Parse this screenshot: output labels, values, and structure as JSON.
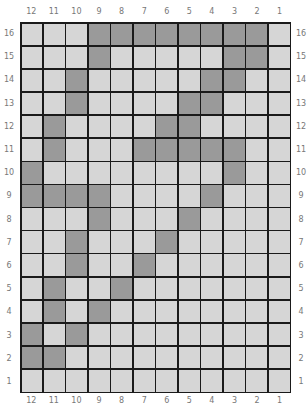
{
  "columns": [
    "12",
    "11",
    "10",
    "9",
    "8",
    "7",
    "6",
    "5",
    "4",
    "3",
    "2",
    "1"
  ],
  "rows": [
    "16",
    "15",
    "14",
    "13",
    "12",
    "11",
    "10",
    "9",
    "8",
    "7",
    "6",
    "5",
    "4",
    "3",
    "2",
    "1"
  ],
  "colors": {
    "light": "#d6d6d6",
    "dark": "#9a9a9a",
    "grid_line": "#1a1a1a"
  },
  "pattern": {
    "16": [
      "9",
      "8",
      "7",
      "6",
      "5",
      "4",
      "3",
      "2"
    ],
    "15": [
      "9",
      "3",
      "2"
    ],
    "14": [
      "10",
      "4",
      "3"
    ],
    "13": [
      "10",
      "5",
      "4"
    ],
    "12": [
      "11",
      "6",
      "5"
    ],
    "11": [
      "11",
      "7",
      "6",
      "5",
      "4",
      "3"
    ],
    "10": [
      "12",
      "3"
    ],
    "9": [
      "12",
      "11",
      "10",
      "9",
      "4"
    ],
    "8": [
      "9",
      "5"
    ],
    "7": [
      "10",
      "6"
    ],
    "6": [
      "10",
      "7"
    ],
    "5": [
      "11",
      "8"
    ],
    "4": [
      "11",
      "9"
    ],
    "3": [
      "12",
      "10"
    ],
    "2": [
      "12",
      "11"
    ],
    "1": []
  }
}
